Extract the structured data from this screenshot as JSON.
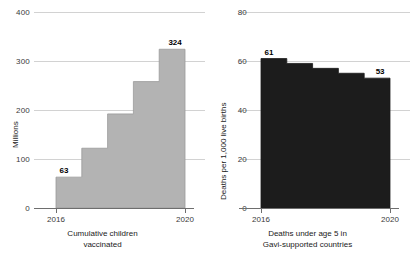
{
  "figure": {
    "panels": [
      {
        "name": "cumulative-children-vaccinated",
        "caption_line1": "Cumulative children",
        "caption_line2": "vaccinated",
        "ylabel": "Millions",
        "yticks": [
          "0",
          "100",
          "200",
          "300",
          "400"
        ],
        "xticks": [
          "2016",
          "2020"
        ],
        "first_label": "63",
        "last_label": "324",
        "fill_color": "#b3b3b3"
      },
      {
        "name": "deaths-under-age-5",
        "caption_line1": "Deaths under age 5 in",
        "caption_line2": "Gavi-supported countries",
        "ylabel": "Deaths per 1,000 live births",
        "yticks": [
          "0",
          "20",
          "40",
          "60",
          "80"
        ],
        "xticks": [
          "2016",
          "2020"
        ],
        "first_label": "61",
        "last_label": "53",
        "fill_color": "#1c1c1c"
      }
    ]
  },
  "chart_data": [
    {
      "type": "area",
      "subtype": "step",
      "title": "Cumulative children vaccinated",
      "xlabel": "",
      "ylabel": "Millions",
      "x": [
        2016,
        2017,
        2018,
        2019,
        2020
      ],
      "values": [
        63,
        122,
        192,
        258,
        324
      ],
      "categories": [
        "2016",
        "2017",
        "2018",
        "2019",
        "2020"
      ],
      "ylim": [
        0,
        400
      ],
      "yticks": [
        0,
        100,
        200,
        300,
        400
      ],
      "xticks_shown": [
        2016,
        2020
      ],
      "grid": true,
      "legend": "none",
      "data_labels": [
        {
          "x": 2016,
          "value": 63,
          "text": "63"
        },
        {
          "x": 2020,
          "value": 324,
          "text": "324"
        }
      ],
      "series_color": "#b3b3b3"
    },
    {
      "type": "area",
      "subtype": "step",
      "title": "Deaths under age 5 in Gavi-supported countries",
      "xlabel": "",
      "ylabel": "Deaths per 1,000 live births",
      "x": [
        2016,
        2017,
        2018,
        2019,
        2020
      ],
      "values": [
        61,
        59,
        57,
        55,
        53
      ],
      "categories": [
        "2016",
        "2017",
        "2018",
        "2019",
        "2020"
      ],
      "ylim": [
        0,
        80
      ],
      "yticks": [
        0,
        20,
        40,
        60,
        80
      ],
      "xticks_shown": [
        2016,
        2020
      ],
      "grid": true,
      "legend": "none",
      "data_labels": [
        {
          "x": 2016,
          "value": 61,
          "text": "61"
        },
        {
          "x": 2020,
          "value": 53,
          "text": "53"
        }
      ],
      "series_color": "#1c1c1c"
    }
  ]
}
